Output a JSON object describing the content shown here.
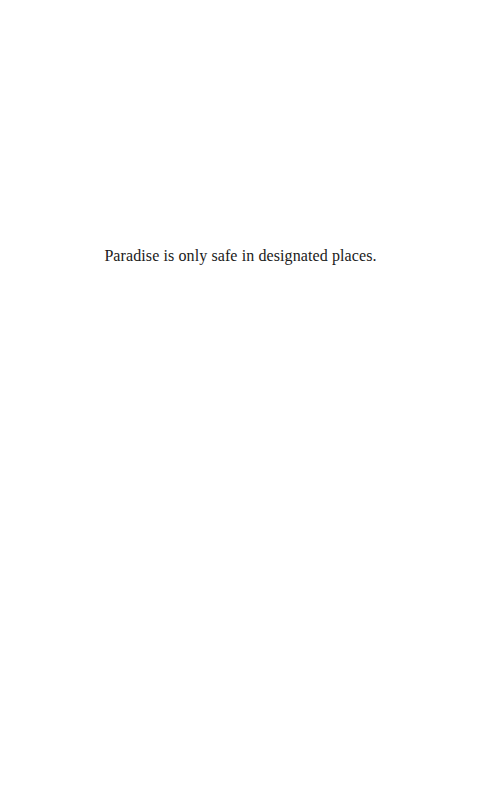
{
  "page": {
    "text_lines": [
      "Paradise is only safe in designated places."
    ]
  }
}
